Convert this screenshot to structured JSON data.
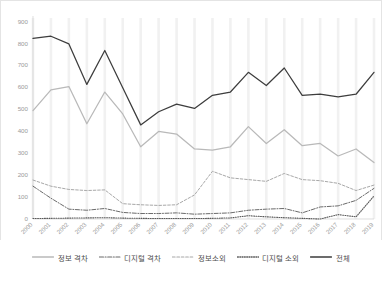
{
  "chart_data": {
    "type": "line",
    "title": "",
    "subtitle": "",
    "xlabel": "",
    "ylabel": "",
    "ylim": [
      0,
      900
    ],
    "yticks": [
      0,
      100,
      200,
      300,
      400,
      500,
      600,
      700,
      800,
      900
    ],
    "grid": "vertical-bands",
    "legend_position": "bottom",
    "categories": [
      "2000",
      "2001",
      "2002",
      "2003",
      "2004",
      "2005",
      "2006",
      "2007",
      "2008",
      "2009",
      "2010",
      "2011",
      "2012",
      "2013",
      "2014",
      "2015",
      "2016",
      "2017",
      "2018",
      "2019"
    ],
    "series": [
      {
        "name": "정보 격차",
        "style": "solid",
        "color": "#b9b9b9",
        "values": [
          495,
          590,
          605,
          435,
          580,
          480,
          330,
          400,
          388,
          320,
          315,
          330,
          422,
          345,
          408,
          335,
          345,
          288,
          320,
          258
        ]
      },
      {
        "name": "디지털 격차",
        "style": "dash-dot",
        "color": "#6b6b6b",
        "values": [
          150,
          95,
          45,
          40,
          48,
          30,
          25,
          25,
          28,
          22,
          25,
          28,
          40,
          45,
          48,
          28,
          55,
          60,
          85,
          140
        ]
      },
      {
        "name": "정보소외",
        "style": "dashed",
        "color": "#a8a8a8",
        "values": [
          178,
          150,
          135,
          130,
          133,
          70,
          65,
          62,
          65,
          110,
          218,
          188,
          180,
          172,
          208,
          180,
          175,
          163,
          130,
          155
        ]
      },
      {
        "name": "디지털 소외",
        "style": "dotted",
        "color": "#5a5a5a",
        "values": [
          2,
          3,
          4,
          5,
          6,
          4,
          3,
          2,
          2,
          2,
          3,
          5,
          15,
          10,
          6,
          3,
          0,
          20,
          10,
          105
        ]
      },
      {
        "name": "전체",
        "style": "solid",
        "color": "#3d3d3d",
        "values": [
          825,
          835,
          800,
          615,
          770,
          600,
          430,
          490,
          525,
          505,
          565,
          580,
          670,
          610,
          690,
          565,
          570,
          558,
          570,
          670
        ]
      }
    ]
  },
  "legend": {
    "items": [
      {
        "label": "정보 격차"
      },
      {
        "label": "디지털 격차"
      },
      {
        "label": "정보소외"
      },
      {
        "label": "디지털 소외"
      },
      {
        "label": "전체"
      }
    ]
  }
}
